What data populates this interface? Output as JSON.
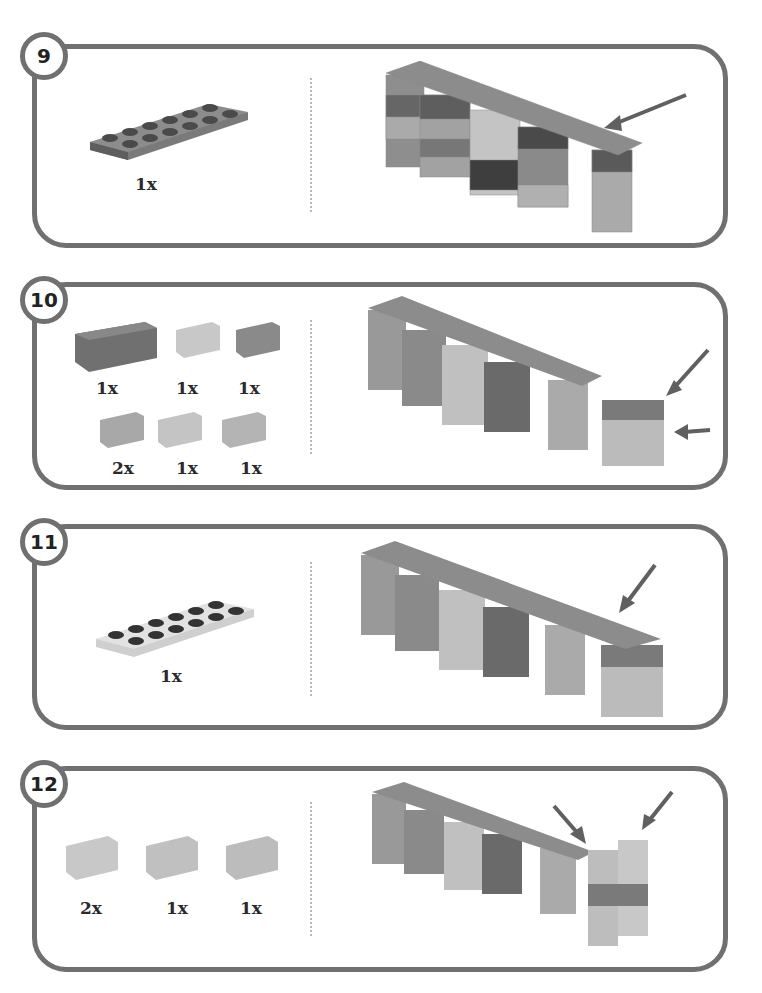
{
  "steps": [
    {
      "number": "9",
      "parts": [
        {
          "piece": "plate-2x6",
          "color": "#6e6e6e",
          "qty": "1x"
        }
      ],
      "callouts": 1
    },
    {
      "number": "10",
      "parts": [
        {
          "piece": "brick-2x4",
          "color": "#6e6e6e",
          "qty": "1x"
        },
        {
          "piece": "brick-1x2",
          "color": "#c8c8c8",
          "qty": "1x"
        },
        {
          "piece": "brick-1x2",
          "color": "#8a8a8a",
          "qty": "1x"
        },
        {
          "piece": "brick-1x2",
          "color": "#a8a8a8",
          "qty": "2x"
        },
        {
          "piece": "brick-1x2",
          "color": "#c4c4c4",
          "qty": "1x"
        },
        {
          "piece": "brick-1x2",
          "color": "#b4b4b4",
          "qty": "1x"
        }
      ],
      "callouts": 2
    },
    {
      "number": "11",
      "parts": [
        {
          "piece": "plate-2x6",
          "color": "#d8d8d8",
          "qty": "1x"
        }
      ],
      "callouts": 1
    },
    {
      "number": "12",
      "parts": [
        {
          "piece": "brick-1x2",
          "color": "#c8c8c8",
          "qty": "2x"
        },
        {
          "piece": "brick-1x2",
          "color": "#c0c0c0",
          "qty": "1x"
        },
        {
          "piece": "brick-1x2",
          "color": "#bcbcbc",
          "qty": "1x"
        }
      ],
      "callouts": 2
    }
  ],
  "colors": {
    "frame": "#707070",
    "arrow": "#606060",
    "divider": "#b8b8b8"
  }
}
